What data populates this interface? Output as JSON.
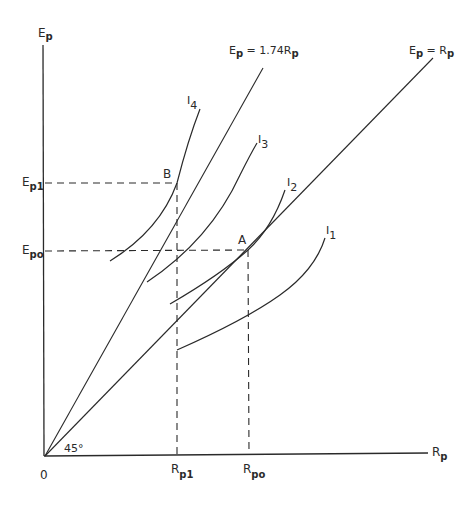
{
  "diagram": {
    "type": "indifference-curve-diagram",
    "axes": {
      "y_label": "E",
      "y_label_sub": "p",
      "x_label": "R",
      "x_label_sub": "p",
      "origin_label": "0",
      "angle_label": "45°"
    },
    "rays": [
      {
        "id": "ray-steep",
        "label_main": "E",
        "label_sub": "p",
        "label_rest": " = 1.74R",
        "label_rest_sub": "p",
        "slope": 1.74
      },
      {
        "id": "ray-45",
        "label_main": "E",
        "label_sub": "p",
        "label_rest": " = R",
        "label_rest_sub": "p",
        "slope": 1.0
      }
    ],
    "indifference_curves": [
      {
        "id": "I1",
        "label": "I",
        "sub": "1"
      },
      {
        "id": "I2",
        "label": "I",
        "sub": "2"
      },
      {
        "id": "I3",
        "label": "I",
        "sub": "3"
      },
      {
        "id": "I4",
        "label": "I",
        "sub": "4"
      }
    ],
    "points": [
      {
        "id": "A",
        "label": "A",
        "on_curve": "I2",
        "on_ray": "ray-45"
      },
      {
        "id": "B",
        "label": "B",
        "on_curve": "I4",
        "on_ray": "ray-steep"
      }
    ],
    "y_ticks": [
      {
        "label": "E",
        "sub": "p1",
        "point": "B"
      },
      {
        "label": "E",
        "sub": "po",
        "point": "A"
      }
    ],
    "x_ticks": [
      {
        "label": "R",
        "sub": "p1",
        "point": "B"
      },
      {
        "label": "R",
        "sub": "po",
        "point": "A"
      }
    ]
  }
}
